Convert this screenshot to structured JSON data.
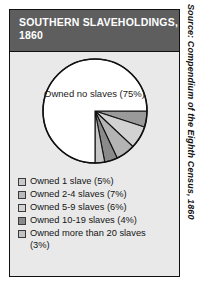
{
  "panel": {
    "title_line1": "SOUTHERN SLAVEHOLDINGS,",
    "title_line2": "1860",
    "title_bg": "#5e5e5e",
    "panel_bg": "#e9e9e9",
    "border_color": "#111111"
  },
  "source_note": "Source: Compendium of the Eighth Census, 1860",
  "chart_data": {
    "type": "pie",
    "title": "SOUTHERN SLAVEHOLDINGS, 1860",
    "center_label": "Owned no slaves\n(75%)",
    "start_angle_deg": 0,
    "direction": "clockwise",
    "legend_position": "bottom",
    "grid": false,
    "categories": [
      "Owned 1 slave (5%)",
      "Owned 2-4 slaves (7%)",
      "Owned 5-9 slaves (6%)",
      "Owned 10-19 slaves (4%)",
      "Owned more than 20 slaves\n   (3%)",
      "Owned no slaves (75%)"
    ],
    "values": [
      5,
      7,
      6,
      4,
      3,
      75
    ],
    "colors": [
      "#9a9a9a",
      "#d2d2d2",
      "#b4b4b4",
      "#8a8a8a",
      "#c6c6c6",
      "#ffffff"
    ],
    "slices": [
      {
        "label": "Owned 1 slave (5%)",
        "value": 5,
        "color": "#9a9a9a"
      },
      {
        "label": "Owned 2-4 slaves (7%)",
        "value": 7,
        "color": "#d2d2d2"
      },
      {
        "label": "Owned 5-9 slaves (6%)",
        "value": 6,
        "color": "#b4b4b4"
      },
      {
        "label": "Owned 10-19 slaves (4%)",
        "value": 4,
        "color": "#8a8a8a"
      },
      {
        "label": "Owned more than 20 slaves (3%)",
        "value": 3,
        "color": "#c6c6c6"
      },
      {
        "label": "Owned no slaves (75%)",
        "value": 75,
        "color": "#ffffff"
      }
    ],
    "legend": [
      {
        "label": "Owned 1 slave (5%)",
        "color": "#c9c9c9"
      },
      {
        "label": "Owned 2-4 slaves (7%)",
        "color": "#b9b9b9"
      },
      {
        "label": "Owned 5-9 slaves (6%)",
        "color": "#d4d4d4"
      },
      {
        "label": "Owned 10-19 slaves (4%)",
        "color": "#8a8a8a"
      },
      {
        "label": "Owned more than 20 slaves\n   (3%)",
        "color": "#c2c2c2"
      }
    ]
  }
}
